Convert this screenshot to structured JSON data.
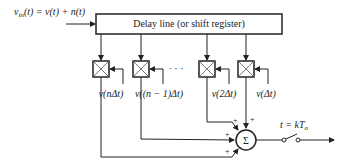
{
  "diagram": {
    "input_label": "v_in(t) = v(t) + n(t)",
    "input_label_parts": {
      "v": "v",
      "sub": "in",
      "rest": "(t) = v(t) + n(t)"
    },
    "delay_line_label": "Delay line (or shift register)",
    "ellipsis": "· · ·",
    "weights": [
      {
        "label": "v(nΔt)"
      },
      {
        "label": "v((n − 1)Δt)"
      },
      {
        "label": "v(2Δt)"
      },
      {
        "label": "v(Δt)"
      }
    ],
    "summer_symbol": "Σ",
    "plus_sign": "+",
    "sample_label": "t = kT",
    "sample_sub": "o"
  }
}
